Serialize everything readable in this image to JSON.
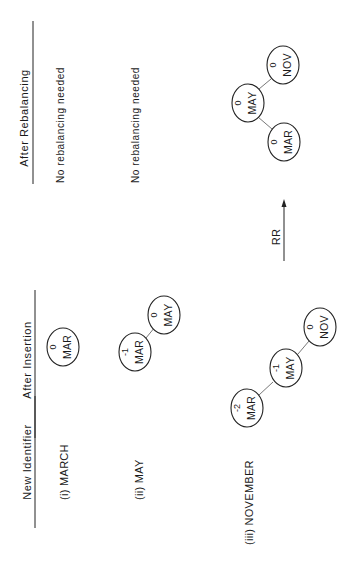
{
  "headers": {
    "new_identifier": "New Identifier",
    "after_insertion": "After Insertion",
    "after_rebalancing": "After Rebalancing"
  },
  "rows": [
    {
      "label": "(i) MARCH",
      "after_insertion": {
        "nodes": [
          {
            "name": "MAR",
            "balance": "0"
          }
        ]
      },
      "rebalancing": {
        "note": "No rebalancing needed"
      }
    },
    {
      "label": "(ii) MAY",
      "after_insertion": {
        "nodes": [
          {
            "name": "MAR",
            "balance": "-1"
          },
          {
            "name": "MAY",
            "balance": "0"
          }
        ]
      },
      "rebalancing": {
        "note": "No rebalancing needed"
      }
    },
    {
      "label": "(iii) NOVEMBER",
      "after_insertion": {
        "nodes": [
          {
            "name": "MAR",
            "balance": "-2"
          },
          {
            "name": "MAY",
            "balance": "-1"
          },
          {
            "name": "NOV",
            "balance": "0"
          }
        ]
      },
      "rebalancing": {
        "rotation": "RR",
        "nodes": [
          {
            "name": "MAY",
            "balance": "0"
          },
          {
            "name": "MAR",
            "balance": "0"
          },
          {
            "name": "NOV",
            "balance": "0"
          }
        ]
      }
    }
  ]
}
